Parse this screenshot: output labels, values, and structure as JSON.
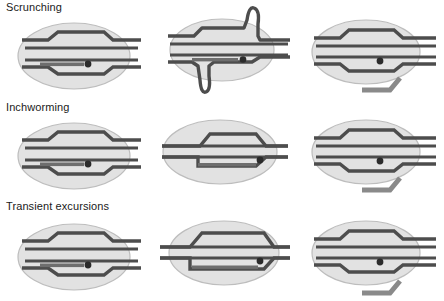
{
  "figure": {
    "type": "molecular-mechanism-diagram",
    "width": 444,
    "height": 301,
    "background": "#ffffff"
  },
  "colors": {
    "dna_strand": "#4d4d4d",
    "dna_strand_dark": "#3a3a3a",
    "polymerase_fill": "#e2e2e2",
    "polymerase_stroke": "#b5b5b5",
    "bubble_fill": "#f4f4f4",
    "rna": "#6e6e6e",
    "active_site_dot": "#2b2b2b",
    "label_text": "#1a1a1a"
  },
  "legend_semantics": {
    "ellipse": "RNA polymerase",
    "double_line": "DNA duplex",
    "hexagon_outline": "transcription bubble",
    "short_bar_with_dot": "nascent RNA with active site",
    "bent_bar": "released RNA transcript"
  },
  "rows": [
    {
      "id": "scrunching",
      "label": "Scrunching",
      "panels": [
        {
          "id": "scrunching-start",
          "state": "closed-bubble",
          "caption": ""
        },
        {
          "id": "scrunching-middle",
          "state": "dna-scrunched-loops",
          "caption": ""
        },
        {
          "id": "scrunching-end",
          "state": "bubble-reset-rna-released",
          "caption": ""
        }
      ]
    },
    {
      "id": "inchworming",
      "label": "Inchworming",
      "panels": [
        {
          "id": "inchworming-start",
          "state": "closed-bubble",
          "caption": ""
        },
        {
          "id": "inchworming-middle",
          "state": "bubble-shifted-downstream",
          "caption": ""
        },
        {
          "id": "inchworming-end",
          "state": "bubble-reset-rna-released",
          "caption": ""
        }
      ]
    },
    {
      "id": "transient-excursions",
      "label": "Transient excursions",
      "panels": [
        {
          "id": "transient-start",
          "state": "closed-bubble",
          "caption": ""
        },
        {
          "id": "transient-middle",
          "state": "bubble-expanded",
          "caption": ""
        },
        {
          "id": "transient-end",
          "state": "bubble-reset-rna-released",
          "caption": ""
        }
      ]
    }
  ]
}
